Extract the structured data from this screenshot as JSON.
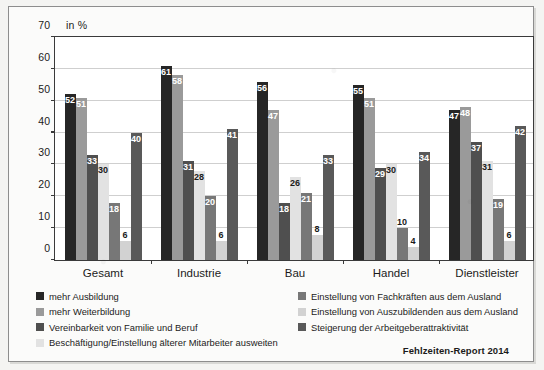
{
  "chart_data": {
    "type": "bar",
    "title": "",
    "subtitle": "",
    "xlabel": "",
    "ylabel": "in %",
    "unit_label": "in %",
    "ylim": [
      0,
      70
    ],
    "yticks": [
      0,
      10,
      20,
      30,
      40,
      50,
      60,
      70
    ],
    "grid": true,
    "legend_position": "bottom",
    "categories": [
      "Gesamt",
      "Industrie",
      "Bau",
      "Handel",
      "Dienstleister"
    ],
    "series": [
      {
        "name": "mehr Ausbildung",
        "color": "#262626",
        "label_color": "#ffffff",
        "values": [
          52,
          61,
          56,
          55,
          47
        ]
      },
      {
        "name": "mehr Weiterbildung",
        "color": "#9a9a9a",
        "label_color": "#ffffff",
        "values": [
          51,
          58,
          47,
          51,
          48
        ]
      },
      {
        "name": "Vereinbarkeit von Familie und Beruf",
        "color": "#4f4f4f",
        "label_color": "#ffffff",
        "values": [
          33,
          31,
          18,
          29,
          37
        ]
      },
      {
        "name": "Beschäftigung/Einstellung älterer Mitarbeiter ausweiten",
        "color": "#e2e2e2",
        "label_color": "#1b1b1b",
        "values": [
          30,
          28,
          26,
          30,
          31
        ]
      },
      {
        "name": "Einstellung von Fachkräften aus dem Ausland",
        "color": "#777777",
        "label_color": "#ffffff",
        "values": [
          18,
          20,
          21,
          10,
          19
        ]
      },
      {
        "name": "Einstellung von Auszubildenden aus dem Ausland",
        "color": "#d2d2d2",
        "label_color": "#1b1b1b",
        "values": [
          6,
          6,
          8,
          4,
          6
        ]
      },
      {
        "name": "Steigerung der Arbeitgeberattraktivität",
        "color": "#595959",
        "label_color": "#ffffff",
        "values": [
          40,
          41,
          33,
          34,
          42
        ]
      }
    ]
  },
  "legend": {
    "left_column": [
      "mehr Ausbildung",
      "mehr Weiterbildung",
      "Vereinbarkeit von Familie und Beruf",
      "Beschäftigung/Einstellung älterer Mitarbeiter ausweiten"
    ],
    "right_column": [
      "Einstellung von Fachkräften aus dem Ausland",
      "Einstellung von Auszubildenden aus dem Ausland",
      "Steigerung der Arbeitgeberattraktivität"
    ]
  },
  "source": {
    "text": "Fehlzeiten-Report 2014"
  },
  "colors": {
    "series_1": "#262626",
    "series_2": "#9a9a9a",
    "series_3": "#4f4f4f",
    "series_4": "#e2e2e2",
    "series_5": "#777777",
    "series_6": "#d2d2d2",
    "series_7": "#595959",
    "axis": "#3a3a3a",
    "grid": "#cfcfcf",
    "page": "#fbfbfa"
  }
}
